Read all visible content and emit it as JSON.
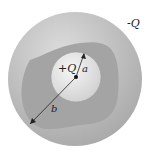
{
  "diagram": {
    "labels": {
      "outer_charge": "-Q",
      "inner_charge": "+Q",
      "inner_radius": "a",
      "outer_radius": "b"
    },
    "colors": {
      "outer_shell": "#b9b9b9",
      "cavity_region": "#a3a3a3",
      "inner_sphere": "#e6e6e6",
      "lines": "#222222"
    }
  }
}
